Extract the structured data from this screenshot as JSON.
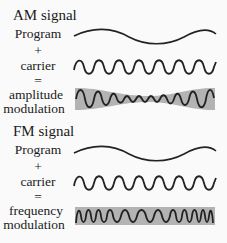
{
  "am": {
    "title": "AM signal",
    "program_label": "Program",
    "plus": "+",
    "carrier_label": "carrier",
    "equals": "=",
    "result_label_1": "amplitude",
    "result_label_2": "modulation"
  },
  "fm": {
    "title": "FM signal",
    "program_label": "Program",
    "plus": "+",
    "carrier_label": "carrier",
    "equals": "=",
    "result_label_1": "frequency",
    "result_label_2": "modulation"
  },
  "colors": {
    "wave": "#222222",
    "envelope": "#b3b3b3",
    "background": "#fafafa"
  }
}
